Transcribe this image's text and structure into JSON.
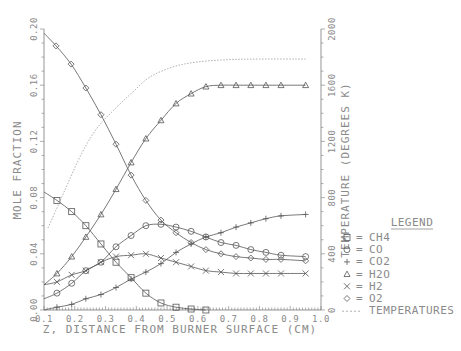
{
  "chart_data": {
    "type": "line",
    "title": "",
    "xlabel": "Z, DISTANCE FROM BURNER SURFACE (CM)",
    "ylabel": "MOLE FRACTION",
    "y2label": "TEMPERATURE (DEGREES K)",
    "xlim": [
      0.1,
      1.0
    ],
    "ylim": [
      0.0,
      0.2
    ],
    "y2lim": [
      0,
      2000
    ],
    "xticks": [
      "0.1",
      "0.2",
      "0.3",
      "0.4",
      "0.5",
      "0.6",
      "0.7",
      "0.8",
      "0.9",
      "1.0"
    ],
    "yticks": [
      "0.00",
      "0.04",
      "0.08",
      "0.12",
      "0.16",
      "0.20"
    ],
    "y2ticks": [
      "0",
      "400",
      "800",
      "1200",
      "1600",
      "2000"
    ],
    "grid": false,
    "legend": {
      "title": "LEGEND",
      "position": "right",
      "entries": [
        {
          "symbol": "□",
          "sep": "=",
          "label": "CH4"
        },
        {
          "symbol": "○",
          "sep": "=",
          "label": "CO"
        },
        {
          "symbol": "+",
          "sep": "=",
          "label": "CO2"
        },
        {
          "symbol": "△",
          "sep": "=",
          "label": "H2O"
        },
        {
          "symbol": "×",
          "sep": "=",
          "label": "H2"
        },
        {
          "symbol": "◇",
          "sep": "=",
          "label": "O2"
        },
        {
          "symbol": "---",
          "sep": "",
          "label": "TEMPERATURES"
        }
      ]
    },
    "series": [
      {
        "name": "CH4",
        "marker": "square",
        "axis": "left",
        "x": [
          0.1,
          0.142,
          0.19,
          0.236,
          0.285,
          0.334,
          0.383,
          0.431,
          0.48,
          0.529,
          0.578,
          0.626
        ],
        "y": [
          0.084,
          0.078,
          0.07,
          0.06,
          0.047,
          0.034,
          0.023,
          0.012,
          0.005,
          0.002,
          0.0007,
          0.0
        ]
      },
      {
        "name": "CO",
        "marker": "circle",
        "axis": "left",
        "x": [
          0.1,
          0.142,
          0.19,
          0.236,
          0.285,
          0.334,
          0.383,
          0.431,
          0.48,
          0.529,
          0.578,
          0.626,
          0.675,
          0.724,
          0.772,
          0.821,
          0.87,
          0.95
        ],
        "y": [
          0.008,
          0.012,
          0.019,
          0.028,
          0.034,
          0.045,
          0.053,
          0.06,
          0.061,
          0.059,
          0.056,
          0.052,
          0.048,
          0.046,
          0.043,
          0.041,
          0.039,
          0.038
        ]
      },
      {
        "name": "CO2",
        "marker": "plus",
        "axis": "left",
        "x": [
          0.1,
          0.142,
          0.19,
          0.236,
          0.285,
          0.334,
          0.383,
          0.431,
          0.48,
          0.529,
          0.578,
          0.626,
          0.675,
          0.724,
          0.772,
          0.821,
          0.87,
          0.95
        ],
        "y": [
          0.0,
          0.002,
          0.004,
          0.008,
          0.011,
          0.016,
          0.022,
          0.027,
          0.033,
          0.041,
          0.047,
          0.052,
          0.055,
          0.059,
          0.062,
          0.065,
          0.067,
          0.068
        ]
      },
      {
        "name": "H2O",
        "marker": "triangle",
        "axis": "left",
        "x": [
          0.1,
          0.142,
          0.19,
          0.236,
          0.285,
          0.334,
          0.383,
          0.431,
          0.48,
          0.529,
          0.578,
          0.626,
          0.675,
          0.724,
          0.772,
          0.821,
          0.87,
          0.95
        ],
        "y": [
          0.018,
          0.026,
          0.038,
          0.052,
          0.068,
          0.086,
          0.105,
          0.122,
          0.135,
          0.147,
          0.154,
          0.159,
          0.16,
          0.16,
          0.16,
          0.16,
          0.16,
          0.16
        ]
      },
      {
        "name": "H2",
        "marker": "x",
        "axis": "left",
        "x": [
          0.1,
          0.142,
          0.19,
          0.236,
          0.285,
          0.334,
          0.383,
          0.431,
          0.48,
          0.529,
          0.578,
          0.626,
          0.675,
          0.724,
          0.772,
          0.821,
          0.87,
          0.95
        ],
        "y": [
          0.018,
          0.02,
          0.025,
          0.028,
          0.034,
          0.038,
          0.039,
          0.04,
          0.037,
          0.034,
          0.031,
          0.028,
          0.027,
          0.026,
          0.026,
          0.026,
          0.026,
          0.026
        ]
      },
      {
        "name": "O2",
        "marker": "diamond",
        "axis": "left",
        "x": [
          0.1,
          0.139,
          0.188,
          0.236,
          0.285,
          0.334,
          0.383,
          0.431,
          0.48,
          0.529,
          0.578,
          0.626,
          0.675,
          0.724,
          0.772,
          0.821,
          0.87,
          0.95
        ],
        "y": [
          0.197,
          0.188,
          0.175,
          0.158,
          0.139,
          0.118,
          0.096,
          0.078,
          0.064,
          0.055,
          0.048,
          0.043,
          0.04,
          0.038,
          0.037,
          0.036,
          0.036,
          0.035
        ]
      },
      {
        "name": "TEMPERATURES",
        "marker": "none",
        "style": "dashed",
        "axis": "right",
        "x": [
          0.113,
          0.168,
          0.223,
          0.275,
          0.337,
          0.389,
          0.444,
          0.519,
          0.597,
          0.7,
          0.8,
          0.95
        ],
        "y": [
          584,
          854,
          1117,
          1302,
          1445,
          1552,
          1658,
          1730,
          1765,
          1782,
          1786,
          1786
        ]
      }
    ]
  }
}
